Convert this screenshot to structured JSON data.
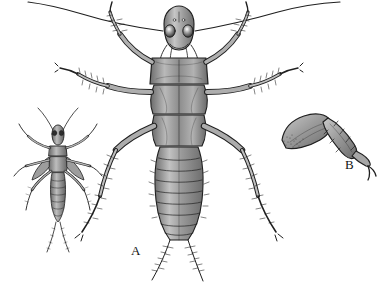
{
  "figure": {
    "caption_labels": {
      "a": "A",
      "b": "B"
    },
    "subjects": [
      {
        "name": "nymph-small-whole-body",
        "description": "small dorsal view of an immature stonefly nymph with two caudal cerci and long antennae",
        "position": "left"
      },
      {
        "name": "nymph-large-whole-body",
        "description": "large dorsal view of a stonefly nymph showing head with two compound eyes, pronotum, meso- and metanotum, three pairs of legs, segmented abdomen and two long cerci",
        "position": "center",
        "label": "A"
      },
      {
        "name": "leg-detail",
        "description": "enlarged detail of a single leg showing femur, tibia with spines, tarsus and paired tarsal claws",
        "position": "right",
        "label": "B"
      }
    ],
    "colors": {
      "background": "#ffffff",
      "ink": "#1a1a1a",
      "body_mid_tone": "#8a8a8a",
      "body_light_tone": "#c8c8c8",
      "body_dark_tone": "#5a5a5a"
    }
  }
}
